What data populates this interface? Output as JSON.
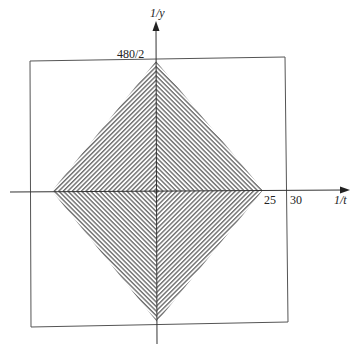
{
  "diagram": {
    "type": "region-plot",
    "axes": {
      "x_label": "1/t",
      "y_label": "1/y",
      "x_ticks": [
        "25",
        "30"
      ],
      "y_ticks": [
        "480/2"
      ]
    },
    "region": {
      "shape": "diamond",
      "x_extent": 25,
      "y_extent": "480/2",
      "fill": "hatched",
      "hatch_color": "#6e6e6e"
    },
    "frame": {
      "shape": "rectangle",
      "x_extent": 30
    },
    "colors": {
      "line": "#333333",
      "frame": "#555555",
      "hatch": "#6e6e6e"
    }
  }
}
